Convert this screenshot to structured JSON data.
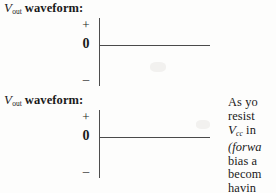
{
  "document": {
    "background_color": "#fdfdfc",
    "ink_color": "#1a1a1a"
  },
  "waveforms": [
    {
      "caption_var": "V",
      "caption_sub": "out",
      "caption_word": "waveform:",
      "axis": {
        "positive_label": "+",
        "zero_label": "0",
        "negative_label": "–"
      },
      "trace": {
        "type": "flat-line",
        "level": "0"
      }
    },
    {
      "caption_var": "V",
      "caption_sub": "out",
      "caption_word": "waveform:",
      "axis": {
        "positive_label": "+",
        "zero_label": "0",
        "negative_label": "–"
      },
      "trace": {
        "type": "flat-line",
        "level": "0"
      }
    }
  ],
  "body_text": {
    "lines": [
      {
        "segments": [
          {
            "text": "As  yo",
            "style": "roman"
          }
        ]
      },
      {
        "segments": [
          {
            "text": "resist",
            "style": "roman"
          }
        ]
      },
      {
        "segments": [
          {
            "text": "V",
            "style": "italic-var"
          },
          {
            "text": "cc",
            "style": "subscript"
          },
          {
            "text": "  in",
            "style": "roman"
          }
        ]
      },
      {
        "segments": [
          {
            "text": "(forwa",
            "style": "italic"
          }
        ]
      },
      {
        "segments": [
          {
            "text": "bias  a",
            "style": "roman"
          }
        ]
      },
      {
        "segments": [
          {
            "text": "becom",
            "style": "roman"
          }
        ]
      },
      {
        "segments": [
          {
            "text": "havin",
            "style": "roman"
          }
        ]
      }
    ]
  }
}
